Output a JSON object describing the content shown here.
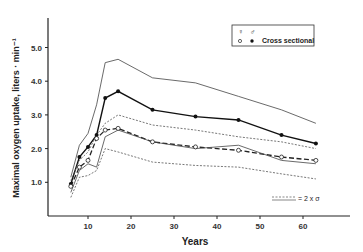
{
  "chart_data": {
    "type": "line",
    "title": "",
    "xlabel": "Years",
    "ylabel": "Maximal oxygen uptake, liters · min⁻¹",
    "xlim": [
      3,
      70
    ],
    "ylim": [
      0,
      6
    ],
    "xticks": [
      "10",
      "20",
      "30",
      "40",
      "50",
      "60"
    ],
    "yticks": [
      "1.0",
      "2.0",
      "3.0",
      "4.0",
      "5.0"
    ],
    "grid": false,
    "legend": {
      "position": "top-right",
      "entries": [
        {
          "symbol": "open-circle",
          "label": "♀"
        },
        {
          "symbol": "filled-circle",
          "label": "♂"
        },
        {
          "label": "Cross sectional"
        }
      ],
      "note": "= 2 x σ",
      "note_position": "bottom-right"
    },
    "x": [
      6,
      8,
      10,
      12,
      14,
      17,
      25,
      35,
      45,
      55,
      63
    ],
    "series": [
      {
        "name": "Male (cross sectional)",
        "marker": "filled-circle",
        "values": [
          0.95,
          1.75,
          2.05,
          2.4,
          3.5,
          3.7,
          3.15,
          2.95,
          2.85,
          2.4,
          2.15
        ]
      },
      {
        "name": "Female (cross sectional)",
        "marker": "open-circle",
        "values": [
          0.88,
          1.45,
          1.65,
          2.3,
          2.55,
          2.6,
          2.2,
          2.05,
          1.95,
          1.75,
          1.65
        ]
      },
      {
        "name": "Male +2σ",
        "style": "solid-thin",
        "values": [
          1.15,
          2.1,
          2.45,
          3.3,
          4.55,
          4.65,
          4.1,
          3.95,
          3.55,
          3.15,
          2.75
        ]
      },
      {
        "name": "Male -2σ",
        "style": "solid-thin",
        "values": [
          0.7,
          1.35,
          1.55,
          1.45,
          2.35,
          2.55,
          2.2,
          2.0,
          2.1,
          1.65,
          1.55
        ]
      },
      {
        "name": "Female +2σ",
        "style": "dashed-thin",
        "values": [
          1.05,
          1.65,
          1.9,
          2.4,
          2.75,
          3.0,
          2.7,
          2.55,
          2.35,
          2.2,
          2.0
        ]
      },
      {
        "name": "Female -2σ",
        "style": "dashed-thin",
        "values": [
          0.55,
          1.15,
          1.2,
          1.35,
          2.0,
          1.9,
          1.6,
          1.5,
          1.45,
          1.25,
          1.1
        ]
      }
    ]
  }
}
